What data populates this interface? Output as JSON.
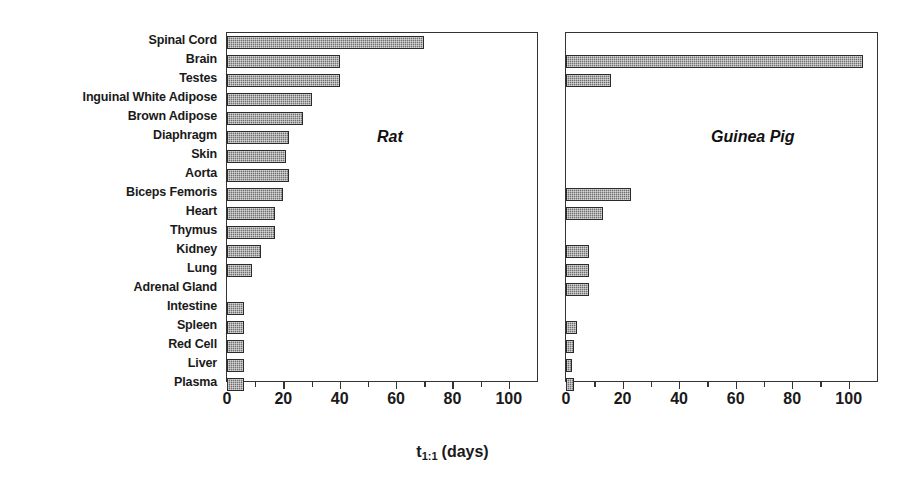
{
  "chart_data": {
    "type": "bar",
    "orientation": "horizontal",
    "title": "",
    "xlabel": "t_1:1 (days)",
    "ylabel": "",
    "xlim": [
      0,
      110
    ],
    "grid": false,
    "legend": "none",
    "categories": [
      "Spinal Cord",
      "Brain",
      "Testes",
      "Inguinal White Adipose",
      "Brown Adipose",
      "Diaphragm",
      "Skin",
      "Aorta",
      "Biceps Femoris",
      "Heart",
      "Thymus",
      "Kidney",
      "Lung",
      "Adrenal Gland",
      "Intestine",
      "Spleen",
      "Red Cell",
      "Liver",
      "Plasma"
    ],
    "series": [
      {
        "name": "Rat",
        "values": [
          70,
          40,
          40,
          30,
          27,
          22,
          21,
          22,
          20,
          17,
          17,
          12,
          9,
          0,
          6,
          6,
          6,
          6,
          6
        ]
      },
      {
        "name": "Guinea Pig",
        "values": [
          0,
          105,
          16,
          0,
          0,
          0,
          0,
          0,
          23,
          13,
          0,
          8,
          8,
          8,
          0,
          4,
          3,
          2,
          3
        ]
      }
    ],
    "panels": [
      {
        "id": "rat",
        "label": "Rat",
        "ticks": [
          0,
          10,
          20,
          30,
          40,
          50,
          60,
          70,
          80,
          90,
          100
        ],
        "tick_labels": [
          "0",
          "",
          "20",
          "",
          "40",
          "",
          "60",
          "",
          "80",
          "",
          "100"
        ]
      },
      {
        "id": "gp",
        "label": "Guinea Pig",
        "ticks": [
          0,
          10,
          20,
          30,
          40,
          50,
          60,
          70,
          80,
          90,
          100
        ],
        "tick_labels": [
          "0",
          "",
          "20",
          "",
          "40",
          "",
          "60",
          "",
          "80",
          "",
          "100"
        ]
      }
    ],
    "colors": {
      "bar_fill": "#6f6f6f",
      "bar_edge": "#2b2b2b",
      "axis": "#333333",
      "text": "#1a1a1a",
      "background": "#ffffff"
    }
  },
  "xcaption": {
    "symbol": "t",
    "subscript": "1:1",
    "units": "(days)"
  }
}
